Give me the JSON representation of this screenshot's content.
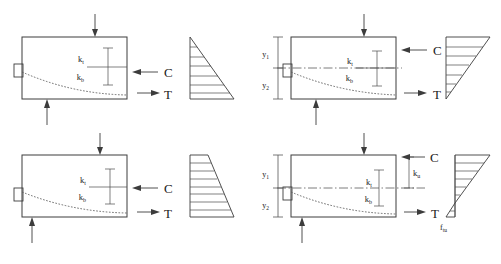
{
  "figure": {
    "type": "engineering-diagram",
    "background_color": "#ffffff",
    "line_color": "#3c3c3c",
    "text_color": "#1a1a1a"
  },
  "labels": {
    "compression": "C",
    "tension": "T",
    "k_top": "k",
    "k_top_sub": "t",
    "k_bottom": "k",
    "k_bottom_sub": "b",
    "k_ultimate": "k",
    "k_ultimate_sub": "u",
    "y_upper": "y",
    "y_upper_sub": "1",
    "y_lower": "y",
    "y_lower_sub": "2",
    "f_tensile_ultimate": "f",
    "f_tensile_ultimate_sub": "tu"
  },
  "panels": [
    {
      "id": "top-left",
      "name": "panel-top-left",
      "beam": {
        "x": 22,
        "y": 37,
        "width": 105,
        "height": 62
      },
      "has_centerline": false,
      "has_y_dimensions": false,
      "has_ku": false,
      "has_ftu": false,
      "load_arrow_x": 95,
      "support_arrow_x": 47,
      "c_label": "C",
      "t_label": "T",
      "k_labels": [
        "kt",
        "kb"
      ],
      "stress_block": {
        "shape": "triangle-apex-top-left",
        "x": 190,
        "y": 37,
        "width": 44,
        "height": 62,
        "hatch_count": 6,
        "top_width_ratio": 0.0,
        "bottom_width_ratio": 1.0
      }
    },
    {
      "id": "top-right",
      "name": "panel-top-right",
      "beam": {
        "x": 291,
        "y": 37,
        "width": 105,
        "height": 62
      },
      "has_centerline": true,
      "has_y_dimensions": true,
      "has_ku": false,
      "has_ftu": false,
      "load_arrow_x": 364,
      "support_arrow_x": 316,
      "c_label": "C",
      "t_label": "T",
      "k_labels": [
        "kt",
        "kb"
      ],
      "y_labels": [
        "y1",
        "y2"
      ],
      "stress_block": {
        "shape": "triangle-apex-bottom-left",
        "x": 446,
        "y": 37,
        "width": 44,
        "height": 62,
        "hatch_count": 6,
        "top_width_ratio": 1.0,
        "bottom_width_ratio": 0.0
      }
    },
    {
      "id": "bottom-left",
      "name": "panel-bottom-left",
      "beam": {
        "x": 22,
        "y": 155,
        "width": 105,
        "height": 62
      },
      "has_centerline": false,
      "has_y_dimensions": false,
      "has_ku": false,
      "has_ftu": false,
      "load_arrow_x": 100,
      "support_arrow_x": 32,
      "c_label": "C",
      "t_label": "T",
      "k_labels": [
        "kt",
        "kb"
      ],
      "stress_block": {
        "shape": "trapezoid-narrow-top",
        "x": 190,
        "y": 155,
        "width": 44,
        "height": 62,
        "hatch_count": 8,
        "top_width_ratio": 0.42,
        "bottom_width_ratio": 1.0
      }
    },
    {
      "id": "bottom-right",
      "name": "panel-bottom-right",
      "beam": {
        "x": 291,
        "y": 155,
        "width": 105,
        "height": 62
      },
      "has_centerline": true,
      "has_y_dimensions": true,
      "has_ku": true,
      "has_ftu": true,
      "load_arrow_x": 364,
      "support_arrow_x": 302,
      "c_label": "C",
      "t_label": "T",
      "k_labels": [
        "kt",
        "kb"
      ],
      "y_labels": [
        "y1",
        "y2"
      ],
      "ku_label": "ku",
      "ftu_label": "ftu",
      "stress_block": {
        "shape": "bilinear-compression-tension",
        "x": 446,
        "y": 155,
        "width": 44,
        "height": 62,
        "hatch_count": 6,
        "neutral_ratio": 0.78
      }
    }
  ]
}
